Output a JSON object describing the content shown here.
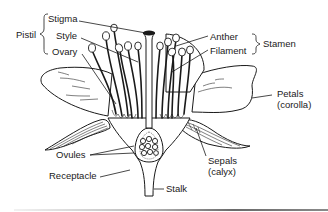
{
  "diagram": {
    "groups": {
      "pistil": {
        "label": "Pistil",
        "parts": [
          "Stigma",
          "Style",
          "Ovary"
        ]
      },
      "stamen": {
        "label": "Stamen",
        "parts": [
          "Anther",
          "Filament"
        ]
      }
    },
    "labels": {
      "pistil": "Pistil",
      "stigma": "Stigma",
      "style": "Style",
      "ovary": "Ovary",
      "anther": "Anther",
      "filament": "Filament",
      "stamen": "Stamen",
      "petals": "Petals",
      "petals_sub": "(corolla)",
      "sepals": "Sepals",
      "sepals_sub": "(calyx)",
      "ovules": "Ovules",
      "receptacle": "Receptacle",
      "stalk": "Stalk"
    },
    "colors": {
      "ink": "#1a1a1a",
      "background": "#ffffff",
      "rule": "#6a6a6a"
    }
  }
}
